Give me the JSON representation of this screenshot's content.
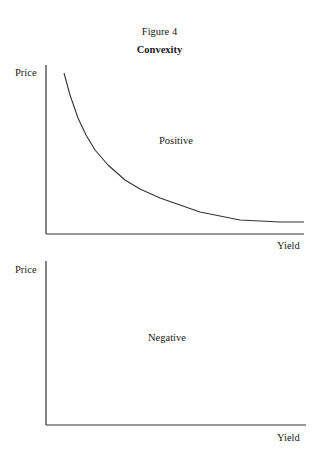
{
  "figure": {
    "label": "Figure 4",
    "title": "Convexity"
  },
  "chart_data": [
    {
      "type": "line",
      "title": "Positive",
      "annotation": "Positive",
      "xlabel": "Yield",
      "ylabel": "Price",
      "grid": false,
      "ticks": false,
      "series": [
        {
          "name": "Price-yield curve (positive convexity)",
          "points_px": [
            [
              64,
              73
            ],
            [
              70,
              95
            ],
            [
              78,
              118
            ],
            [
              86,
              135
            ],
            [
              95,
              150
            ],
            [
              108,
              165
            ],
            [
              125,
              180
            ],
            [
              140,
              189
            ],
            [
              160,
              198
            ],
            [
              180,
              205
            ],
            [
              200,
              212
            ],
            [
              220,
              216
            ],
            [
              240,
              220
            ],
            [
              260,
              221
            ],
            [
              280,
              222
            ],
            [
              304,
              222
            ]
          ]
        }
      ]
    },
    {
      "type": "line",
      "title": "Negative",
      "annotation": "Negative",
      "xlabel": "Yield",
      "ylabel": "Price",
      "grid": false,
      "ticks": false,
      "series": []
    }
  ],
  "top_chart": {
    "ylabel": "Price",
    "xlabel": "Yield",
    "annotation": "Positive"
  },
  "bottom_chart": {
    "ylabel": "Price",
    "xlabel": "Yield",
    "annotation": "Negative"
  }
}
